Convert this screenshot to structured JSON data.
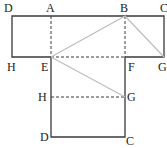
{
  "diagram": {
    "type": "geometry-folding",
    "colors": {
      "solid": "#3a3a3a",
      "dashed": "#3a3a3a",
      "fold": "#bdbdbd"
    },
    "points": {
      "top_D": {
        "label": "D",
        "x": 12,
        "y": 16
      },
      "top_A": {
        "label": "A",
        "x": 51,
        "y": 16
      },
      "top_B": {
        "label": "B",
        "x": 125,
        "y": 16
      },
      "top_C": {
        "label": "C",
        "x": 164,
        "y": 16
      },
      "top_H": {
        "label": "H",
        "x": 12,
        "y": 57
      },
      "E": {
        "label": "E",
        "x": 51,
        "y": 57
      },
      "F": {
        "label": "F",
        "x": 125,
        "y": 57
      },
      "top_G": {
        "label": "G",
        "x": 164,
        "y": 57
      },
      "bot_H": {
        "label": "H",
        "x": 51,
        "y": 97
      },
      "bot_G": {
        "label": "G",
        "x": 125,
        "y": 97
      },
      "bot_D": {
        "label": "D",
        "x": 51,
        "y": 137
      },
      "bot_C": {
        "label": "C",
        "x": 125,
        "y": 137
      }
    },
    "labels": {
      "D1": "D",
      "A": "A",
      "B": "B",
      "C1": "C",
      "H1": "H",
      "E": "E",
      "F": "F",
      "G1": "G",
      "H2": "H",
      "G2": "G",
      "D2": "D",
      "C2": "C"
    }
  }
}
